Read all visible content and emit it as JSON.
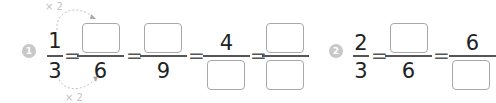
{
  "problems": [
    {
      "number": "1",
      "annotations": {
        "top": "× 2",
        "bottom": "× 2"
      },
      "fractions": [
        {
          "numerator": "1",
          "denominator": "3"
        },
        {
          "numerator": "",
          "denominator": "6"
        },
        {
          "numerator": "",
          "denominator": "9"
        },
        {
          "numerator": "4",
          "denominator": ""
        },
        {
          "numerator": "",
          "denominator": ""
        }
      ],
      "equals": "="
    },
    {
      "number": "2",
      "fractions": [
        {
          "numerator": "2",
          "denominator": "3"
        },
        {
          "numerator": "",
          "denominator": "6"
        },
        {
          "numerator": "6",
          "denominator": ""
        }
      ],
      "equals": "="
    }
  ]
}
